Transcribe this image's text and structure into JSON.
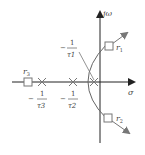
{
  "diagram": {
    "type": "root-locus",
    "axes": {
      "imag_label": "jω",
      "real_label": "σ"
    },
    "poles": [
      {
        "label_num": "1",
        "label_den": "τ1",
        "sign": "−",
        "sub": "1"
      },
      {
        "label_num": "1",
        "label_den": "τ2",
        "sign": "−",
        "sub": "2"
      },
      {
        "label_num": "1",
        "label_den": "τ3",
        "sign": "−",
        "sub": "3"
      }
    ],
    "roots": [
      {
        "label": "r",
        "sub": "1"
      },
      {
        "label": "r",
        "sub": "2"
      },
      {
        "label": "r",
        "sub": "3"
      }
    ],
    "colors": {
      "axis": "#222222",
      "locus": "#666666",
      "arrow": "#777777",
      "text": "#444444"
    }
  }
}
